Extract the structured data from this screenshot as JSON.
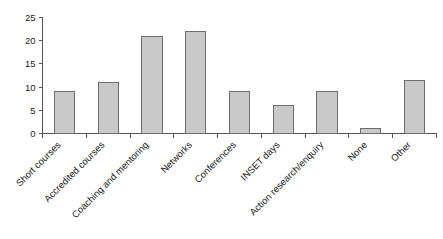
{
  "chart_data": {
    "type": "bar",
    "title": "",
    "subtitle": "",
    "xlabel": "",
    "ylabel": "",
    "categories": [
      "Short courses",
      "Accredited courses",
      "Coaching and mentoring",
      "Networks",
      "Conferences",
      "INSET days",
      "Action research/enquiry",
      "None",
      "Other"
    ],
    "values": [
      9,
      11,
      21,
      22,
      9,
      6,
      9,
      1,
      11.5
    ],
    "ylim": [
      0,
      25
    ],
    "ytick_values": [
      0,
      5,
      10,
      15,
      20,
      25
    ],
    "ytick_labels": [
      "0",
      "5",
      "10",
      "15",
      "20",
      "25"
    ],
    "grid": false,
    "legend": "none",
    "bar_fill_color": "#c9c9c9",
    "bar_edge_color": "#6e6e6e",
    "axis_color": "#555555",
    "xtick_label_rotation": 45
  }
}
